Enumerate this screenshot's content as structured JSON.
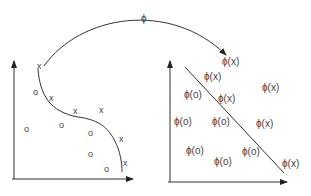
{
  "diagram": {
    "mapping_label": "ϕ",
    "input_space": {
      "x_points": [
        {
          "label": "x",
          "x": 40,
          "y": 68
        },
        {
          "label": "x",
          "x": 52,
          "y": 99
        },
        {
          "label": "x",
          "x": 76,
          "y": 112
        },
        {
          "label": "x",
          "x": 102,
          "y": 111
        },
        {
          "label": "x",
          "x": 122,
          "y": 140
        },
        {
          "label": "x",
          "x": 126,
          "y": 164
        }
      ],
      "o_points": [
        {
          "label": "o",
          "x": 36,
          "y": 94
        },
        {
          "label": "o",
          "x": 27,
          "y": 131
        },
        {
          "label": "o",
          "x": 62,
          "y": 127
        },
        {
          "label": "o",
          "x": 91,
          "y": 135
        },
        {
          "label": "o",
          "x": 91,
          "y": 156
        },
        {
          "label": "o",
          "x": 107,
          "y": 171
        }
      ]
    },
    "feature_space": {
      "x_points": [
        {
          "label": "ϕ(x)",
          "x": 222,
          "y": 62
        },
        {
          "label": "ϕ(x)",
          "x": 204,
          "y": 77
        },
        {
          "label": "ϕ(x)",
          "x": 218,
          "y": 99
        },
        {
          "label": "ϕ(x)",
          "x": 262,
          "y": 88
        },
        {
          "label": "ϕ(x)",
          "x": 256,
          "y": 124
        },
        {
          "label": "ϕ(x)",
          "x": 282,
          "y": 164
        }
      ],
      "o_points": [
        {
          "label": "ϕ(o)",
          "x": 184,
          "y": 95
        },
        {
          "label": "ϕ(o)",
          "x": 174,
          "y": 122
        },
        {
          "label": "ϕ(o)",
          "x": 212,
          "y": 122
        },
        {
          "label": "ϕ(o)",
          "x": 186,
          "y": 151
        },
        {
          "label": "ϕ(o)",
          "x": 214,
          "y": 162
        },
        {
          "label": "ϕ(o)",
          "x": 242,
          "y": 152
        }
      ]
    }
  }
}
